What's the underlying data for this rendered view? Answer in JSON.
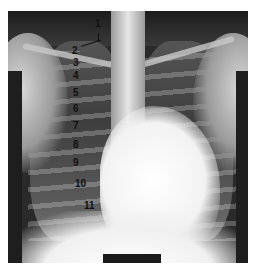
{
  "figure": {
    "labels": [
      {
        "text": "1",
        "x": 95,
        "y": 19
      },
      {
        "text": "2",
        "x": 72,
        "y": 46
      },
      {
        "text": "3",
        "x": 73,
        "y": 58
      },
      {
        "text": "4",
        "x": 73,
        "y": 71
      },
      {
        "text": "5",
        "x": 73,
        "y": 88
      },
      {
        "text": "6",
        "x": 73,
        "y": 104
      },
      {
        "text": "7",
        "x": 73,
        "y": 121
      },
      {
        "text": "8",
        "x": 73,
        "y": 140
      },
      {
        "text": "9",
        "x": 73,
        "y": 158
      },
      {
        "text": "10",
        "x": 75,
        "y": 179
      },
      {
        "text": "11",
        "x": 84,
        "y": 201
      }
    ],
    "scale_bar_color": "#1a1a1a"
  }
}
